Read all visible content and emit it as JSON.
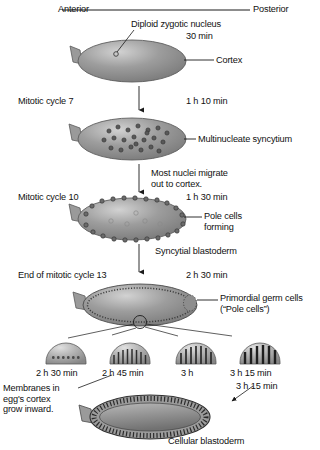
{
  "figure": {
    "axis_labels": {
      "anterior": "Anterior",
      "posterior": "Posterior"
    }
  },
  "stages": [
    {
      "id": "zygote",
      "cycle_label": "",
      "time": "30 min",
      "callouts": [
        {
          "name": "nucleus",
          "text": "Diploid zygotic nucleus"
        },
        {
          "name": "cortex",
          "text": "Cortex"
        }
      ]
    },
    {
      "id": "multinucleate-syncytium",
      "cycle_label": "Mitotic cycle 7",
      "time": "1 h 10 min",
      "callouts": [
        {
          "name": "syncytium",
          "text": "Multinucleate syncytium"
        }
      ]
    },
    {
      "id": "syncytial-blastoderm",
      "cycle_label": "Mitotic cycle 10",
      "time": "1 h 30 min",
      "transition_note": "Most nuclei migrate\nout to cortex.",
      "callouts": [
        {
          "name": "pole-cells-forming",
          "text": "Pole cells\nforming"
        },
        {
          "name": "syncytial-blastoderm",
          "text": "Syncytial blastoderm"
        }
      ]
    },
    {
      "id": "end-cycle-13",
      "cycle_label": "End of mitotic cycle 13",
      "time": "2 h 30 min",
      "callouts": [
        {
          "name": "primordial-germ-cells",
          "text": "Primordial germ cells\n(“Pole cells”)"
        }
      ]
    },
    {
      "id": "cellular-blastoderm",
      "cycle_label": "",
      "time": "3 h 15 min",
      "callouts": [
        {
          "name": "cellular-blastoderm",
          "text": "Cellular blastoderm"
        }
      ]
    }
  ],
  "detail_insets": {
    "note": "Membranes in\negg's cortex\ngrow inward.",
    "items": [
      {
        "id": "inset-1",
        "time": "2 h 30 min",
        "furrow_count": 7,
        "furrow_depth": 2.5
      },
      {
        "id": "inset-2",
        "time": "2 h 45 min",
        "furrow_count": 9,
        "furrow_depth": 9
      },
      {
        "id": "inset-3",
        "time": "3 h",
        "furrow_count": 8,
        "furrow_depth": 13
      },
      {
        "id": "inset-4",
        "time": "3 h 15 min",
        "furrow_count": 6,
        "furrow_depth": 16
      }
    ]
  },
  "colors": {
    "embryo_light": "#c9c9c9",
    "embryo_mid": "#8e8e8e",
    "embryo_dark": "#6d6d6d",
    "outline": "#4a4a4a",
    "text": "#111111",
    "nucleus": "#4f4f4f"
  }
}
